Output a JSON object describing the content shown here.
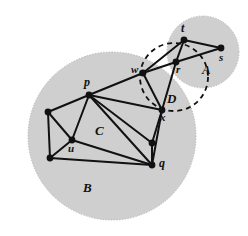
{
  "figure": {
    "background_color": "#ffffff",
    "disk_fill_color": "#cfcfcf",
    "edge_color": "#111111",
    "vertex_color": "#111111",
    "dashed_color": "#111111",
    "width": 248,
    "height": 236
  },
  "regions": [
    {
      "name": "disk-B",
      "label": "B",
      "label_x": 83,
      "label_y": 181,
      "label_size": 13,
      "cx": 112,
      "cy": 136,
      "r": 84,
      "style": "filled-gray-dotted-edge"
    },
    {
      "name": "disk-A",
      "label": "A",
      "label_x": 202,
      "label_y": 63,
      "label_size": 13,
      "cx": 203,
      "cy": 52,
      "r": 36,
      "style": "filled-gray-dotted-edge"
    },
    {
      "name": "circle-D",
      "label": "D",
      "label_x": 167,
      "label_y": 92,
      "label_size": 13,
      "cx": 174,
      "cy": 77,
      "r": 34,
      "style": "dashed-outline"
    }
  ],
  "inner_labels": [
    {
      "name": "label-C",
      "text": "C",
      "x": 95,
      "y": 124,
      "size": 13
    }
  ],
  "vertices": [
    {
      "name": "vertex-p",
      "id": "p",
      "x": 89,
      "y": 95,
      "label": "p",
      "label_x": 84,
      "label_y": 76,
      "label_size": 12
    },
    {
      "name": "vertex-l1",
      "id": "l1",
      "x": 48,
      "y": 112,
      "label": "",
      "label_x": 0,
      "label_y": 0,
      "label_size": 0
    },
    {
      "name": "vertex-u",
      "id": "u",
      "x": 72,
      "y": 140,
      "label": "u",
      "label_x": 68,
      "label_y": 143,
      "label_size": 11
    },
    {
      "name": "vertex-l2",
      "id": "l2",
      "x": 50,
      "y": 158,
      "label": "",
      "label_x": 0,
      "label_y": 0,
      "label_size": 0
    },
    {
      "name": "vertex-q",
      "id": "q",
      "x": 152,
      "y": 165,
      "label": "q",
      "label_x": 159,
      "label_y": 157,
      "label_size": 12
    },
    {
      "name": "vertex-m",
      "id": "m",
      "x": 152,
      "y": 143,
      "label": "",
      "label_x": 0,
      "label_y": 0,
      "label_size": 0
    },
    {
      "name": "vertex-x",
      "id": "x",
      "x": 162,
      "y": 110,
      "label": "x",
      "label_x": 160,
      "label_y": 112,
      "label_size": 11
    },
    {
      "name": "vertex-w",
      "id": "w",
      "x": 143,
      "y": 73,
      "label": "w",
      "label_x": 131,
      "label_y": 64,
      "label_size": 11
    },
    {
      "name": "vertex-r",
      "id": "r",
      "x": 176,
      "y": 62,
      "label": "r",
      "label_x": 176,
      "label_y": 64,
      "label_size": 11
    },
    {
      "name": "vertex-t",
      "id": "t",
      "x": 184,
      "y": 40,
      "label": "t",
      "label_x": 181,
      "label_y": 22,
      "label_size": 12
    },
    {
      "name": "vertex-s",
      "id": "s",
      "x": 221,
      "y": 48,
      "label": "s",
      "label_x": 219,
      "label_y": 52,
      "label_size": 11
    }
  ],
  "edges": [
    {
      "name": "edge-p-l1",
      "from": "p",
      "to": "l1"
    },
    {
      "name": "edge-p-u",
      "from": "p",
      "to": "u"
    },
    {
      "name": "edge-p-m",
      "from": "p",
      "to": "m"
    },
    {
      "name": "edge-p-q",
      "from": "p",
      "to": "q"
    },
    {
      "name": "edge-p-x",
      "from": "p",
      "to": "x"
    },
    {
      "name": "edge-p-w",
      "from": "p",
      "to": "w"
    },
    {
      "name": "edge-l1-u",
      "from": "l1",
      "to": "u"
    },
    {
      "name": "edge-l1-l2",
      "from": "l1",
      "to": "l2"
    },
    {
      "name": "edge-u-l2",
      "from": "u",
      "to": "l2"
    },
    {
      "name": "edge-u-q",
      "from": "u",
      "to": "q"
    },
    {
      "name": "edge-l2-q",
      "from": "l2",
      "to": "q"
    },
    {
      "name": "edge-m-q",
      "from": "m",
      "to": "q"
    },
    {
      "name": "edge-x-m",
      "from": "x",
      "to": "m"
    },
    {
      "name": "edge-x-q",
      "from": "x",
      "to": "q"
    },
    {
      "name": "edge-w-x",
      "from": "w",
      "to": "x"
    },
    {
      "name": "edge-w-r",
      "from": "w",
      "to": "r"
    },
    {
      "name": "edge-w-t",
      "from": "w",
      "to": "t"
    },
    {
      "name": "edge-x-r",
      "from": "x",
      "to": "r"
    },
    {
      "name": "edge-r-t",
      "from": "r",
      "to": "t"
    },
    {
      "name": "edge-r-s",
      "from": "r",
      "to": "s"
    },
    {
      "name": "edge-t-s",
      "from": "t",
      "to": "s"
    }
  ]
}
